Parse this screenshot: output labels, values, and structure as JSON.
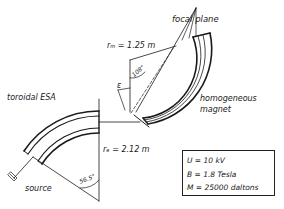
{
  "labels": {
    "focal_plane": "focal plane",
    "r_m": "rₘ = 1.25 m",
    "angle_108": "108°",
    "epsilon": "ε",
    "toroidal_esa": "toroidal ESA",
    "homogeneous": "homogeneous",
    "magnet": "magnet",
    "r_e": "rₑ = 2.12 m",
    "angle_56": "56.5°",
    "source": "source"
  },
  "parameters": [
    {
      "text": "U = 10 kV"
    },
    {
      "text": "B = 1.8  Tesla"
    },
    {
      "text": "M = 25000 daltons"
    }
  ],
  "colors": {
    "ink": "#1a1a1a",
    "background": "#ffffff"
  }
}
